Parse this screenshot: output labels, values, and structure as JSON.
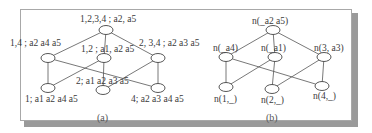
{
  "figure": {
    "panel_a": {
      "caption": "(a)",
      "nodes": [
        {
          "id": "top",
          "label": "1,2,3,4 ; a2, a5"
        },
        {
          "id": "mid_left",
          "label": "1,4 ; a2 a4 a5"
        },
        {
          "id": "mid_center",
          "label": "1,2 ; a1, a2 a5"
        },
        {
          "id": "mid_right",
          "label": "2, 3,4 ; a2 a3 a5"
        },
        {
          "id": "bot_left",
          "label": "1; a1 a2 a4 a5"
        },
        {
          "id": "bot_center",
          "label": "2; a1 a2 a3 a5"
        },
        {
          "id": "bot_right",
          "label": "4; a2 a3 a4 a5"
        }
      ],
      "edges": [
        [
          "top",
          "mid_left"
        ],
        [
          "top",
          "mid_center"
        ],
        [
          "top",
          "mid_right"
        ],
        [
          "mid_left",
          "bot_left"
        ],
        [
          "mid_left",
          "bot_right"
        ],
        [
          "mid_center",
          "bot_left"
        ],
        [
          "mid_center",
          "bot_center"
        ],
        [
          "mid_right",
          "bot_center"
        ],
        [
          "mid_right",
          "bot_right"
        ]
      ]
    },
    "panel_b": {
      "caption": "(b)",
      "nodes": [
        {
          "id": "top",
          "label": "n(_a2 a5)"
        },
        {
          "id": "mid_left",
          "label": "n(_a4)"
        },
        {
          "id": "mid_center",
          "label": "n(_a1)"
        },
        {
          "id": "mid_right",
          "label": "n(3, a3)"
        },
        {
          "id": "bot_left",
          "label": "n(1,_)"
        },
        {
          "id": "bot_center",
          "label": "n(2,_)"
        },
        {
          "id": "bot_right",
          "label": "n(4,_)"
        }
      ],
      "edges": [
        [
          "top",
          "mid_left"
        ],
        [
          "top",
          "mid_center"
        ],
        [
          "top",
          "mid_right"
        ],
        [
          "mid_left",
          "bot_left"
        ],
        [
          "mid_left",
          "bot_right"
        ],
        [
          "mid_center",
          "bot_left"
        ],
        [
          "mid_center",
          "bot_center"
        ],
        [
          "mid_right",
          "bot_center"
        ],
        [
          "mid_right",
          "bot_right"
        ]
      ]
    }
  }
}
